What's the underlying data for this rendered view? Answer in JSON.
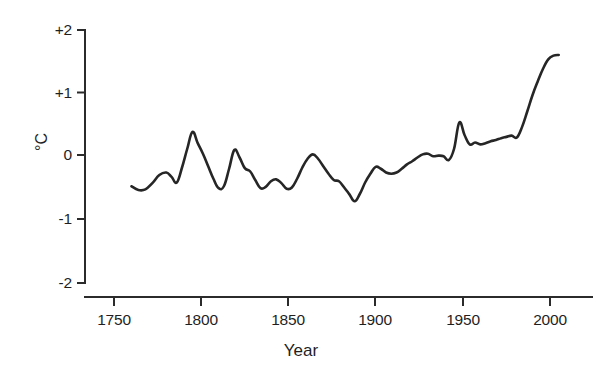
{
  "chart_data": {
    "type": "line",
    "title": "",
    "subtitle": "",
    "xlabel": "Year",
    "ylabel": "°C",
    "xlim": [
      1735,
      2020
    ],
    "ylim": [
      -2,
      2
    ],
    "grid": false,
    "legend": null,
    "xticks": [
      1750,
      1800,
      1850,
      1900,
      1950,
      2000
    ],
    "xtick_labels": [
      "1750",
      "1800",
      "1850",
      "1900",
      "1950",
      "2000"
    ],
    "yticks": [
      2,
      1,
      0,
      -1,
      -2
    ],
    "ytick_labels": [
      "+2",
      "+1",
      "0",
      "-1",
      "-2"
    ],
    "series": [
      {
        "name": "Temperature anomaly",
        "color": "#262626",
        "x": [
          1760,
          1764,
          1768,
          1772,
          1776,
          1780,
          1783,
          1786,
          1789,
          1792,
          1795,
          1798,
          1801,
          1804,
          1807,
          1810,
          1813,
          1816,
          1819,
          1822,
          1825,
          1828,
          1831,
          1834,
          1837,
          1840,
          1843,
          1846,
          1849,
          1852,
          1855,
          1858,
          1861,
          1864,
          1867,
          1870,
          1873,
          1876,
          1879,
          1882,
          1885,
          1888,
          1891,
          1894,
          1897,
          1900,
          1903,
          1906,
          1909,
          1912,
          1915,
          1918,
          1921,
          1924,
          1927,
          1930,
          1933,
          1936,
          1939,
          1942,
          1945,
          1948,
          1951,
          1954,
          1957,
          1960,
          1963,
          1966,
          1969,
          1972,
          1975,
          1978,
          1981,
          1984,
          1987,
          1990,
          1993,
          1996,
          1999,
          2002,
          2005
        ],
        "y": [
          -0.5,
          -0.56,
          -0.55,
          -0.45,
          -0.32,
          -0.28,
          -0.35,
          -0.44,
          -0.2,
          0.1,
          0.37,
          0.19,
          0.02,
          -0.18,
          -0.38,
          -0.53,
          -0.5,
          -0.22,
          0.08,
          -0.04,
          -0.21,
          -0.26,
          -0.4,
          -0.53,
          -0.51,
          -0.42,
          -0.39,
          -0.45,
          -0.54,
          -0.52,
          -0.38,
          -0.2,
          -0.06,
          0.01,
          -0.06,
          -0.18,
          -0.3,
          -0.4,
          -0.42,
          -0.52,
          -0.63,
          -0.74,
          -0.62,
          -0.44,
          -0.3,
          -0.19,
          -0.22,
          -0.28,
          -0.3,
          -0.28,
          -0.22,
          -0.15,
          -0.1,
          -0.04,
          0.01,
          0.02,
          -0.02,
          -0.01,
          -0.02,
          -0.08,
          0.1,
          0.52,
          0.32,
          0.17,
          0.2,
          0.17,
          0.19,
          0.22,
          0.24,
          0.27,
          0.29,
          0.31,
          0.28,
          0.45,
          0.7,
          0.96,
          1.18,
          1.38,
          1.53,
          1.59,
          1.6
        ],
        "units": "°C"
      }
    ],
    "annotations": []
  },
  "axis_titles": {
    "x": "Year",
    "y": "°C"
  },
  "colors": {
    "line": "#262626",
    "axis": "#2b2b2b",
    "background": "#ffffff",
    "text": "#1f1f1f"
  }
}
